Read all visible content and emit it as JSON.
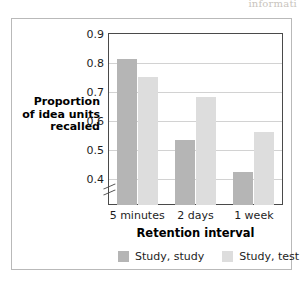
{
  "page_bleed_text": "informati",
  "chart_data": {
    "type": "bar",
    "title": "",
    "xlabel": "Retention interval",
    "ylabel": "Proportion of idea units recalled",
    "ylabel_lines": [
      "Proportion",
      "of idea units",
      "recalled"
    ],
    "categories": [
      "5 minutes",
      "2 days",
      "1 week"
    ],
    "series": [
      {
        "name": "Study, study",
        "color": "#b5b5b5",
        "values": [
          0.81,
          0.53,
          0.42
        ]
      },
      {
        "name": "Study, test",
        "color": "#dddddd",
        "values": [
          0.75,
          0.68,
          0.56
        ]
      }
    ],
    "ylim": [
      0.4,
      0.9
    ],
    "yticks": [
      0.9,
      0.8,
      0.7,
      0.6,
      0.5,
      0.4
    ],
    "ytick_labels": [
      "0.9",
      "0.8",
      "0.7",
      "0.6",
      "0.5",
      "0.4"
    ],
    "axis_break": true,
    "grid": true,
    "legend_position": "bottom"
  }
}
